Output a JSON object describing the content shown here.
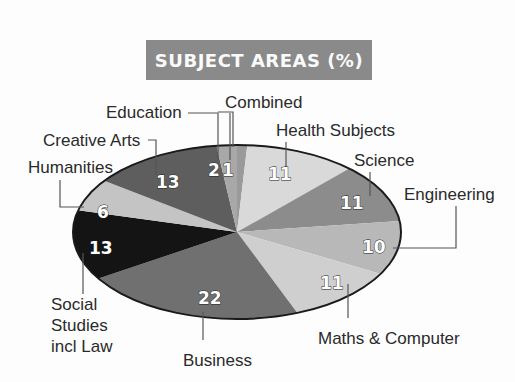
{
  "chart_data": {
    "type": "pie",
    "title": "SUBJECT AREAS (%)",
    "categories": [
      "Combined",
      "Health Subjects",
      "Science",
      "Engineering",
      "Maths & Computer",
      "Business",
      "Social Studies incl Law",
      "Humanities",
      "Creative Arts",
      "Education"
    ],
    "values": [
      1,
      11,
      11,
      10,
      11,
      22,
      13,
      6,
      13,
      2
    ],
    "colors": [
      "#9a9a9a",
      "#d9d9d9",
      "#8c8c8c",
      "#b8b8b8",
      "#cfcfcf",
      "#707070",
      "#141414",
      "#c4c4c4",
      "#5e5e5e",
      "#a8a8a8"
    ],
    "start_angle_deg": 0,
    "direction": "clockwise",
    "legend": "none (callout labels)"
  },
  "title": "SUBJECT AREAS (%)",
  "labels": {
    "combined": "Combined",
    "health": "Health Subjects",
    "science": "Science",
    "engineering": "Engineering",
    "maths": "Maths & Computer",
    "business": "Business",
    "social_1": "Social",
    "social_2": "Studies",
    "social_3": "incl Law",
    "humanities": "Humanities",
    "creative": "Creative Arts",
    "education": "Education"
  },
  "values_text": {
    "combined": "1",
    "health": "11",
    "science": "11",
    "engineering": "10",
    "maths": "11",
    "business": "22",
    "social": "13",
    "humanities": "6",
    "creative": "13",
    "education": "2"
  }
}
